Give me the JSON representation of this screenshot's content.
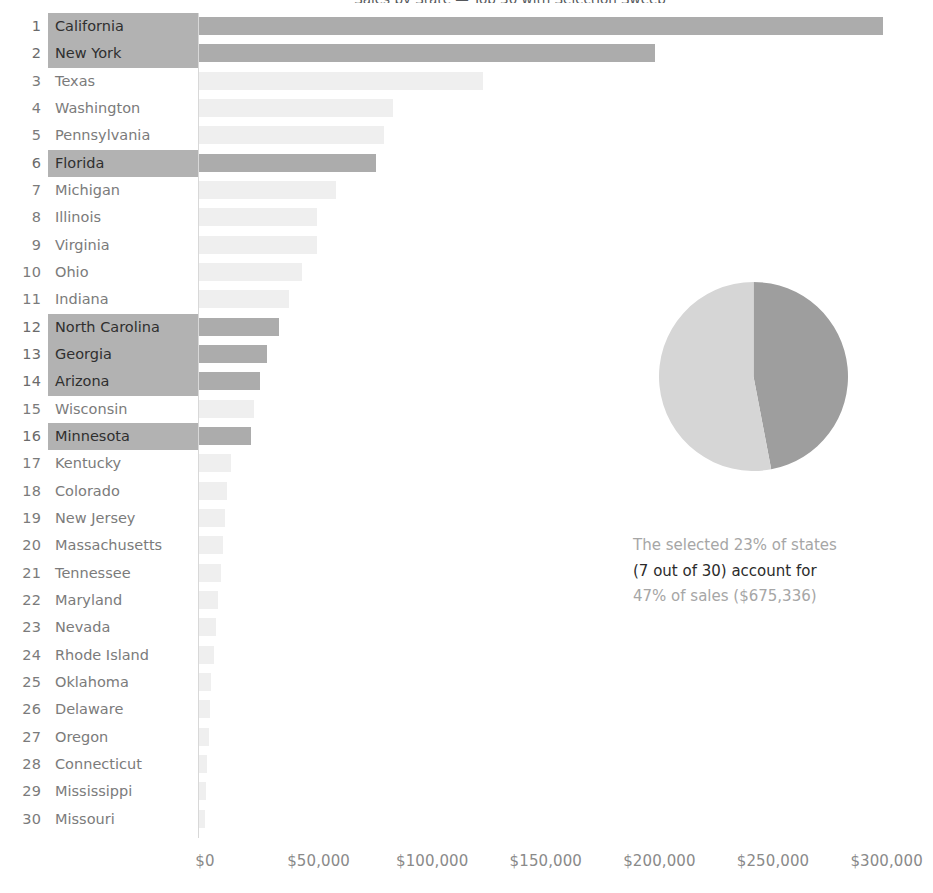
{
  "chart": {
    "title": "Sales by State — Top 30 with Selection Sweep",
    "axis_line_color": "#d8d8d8",
    "selected_color": "#acacac",
    "unselected_color": "#efefef",
    "highlight_color": "#b2b2b2"
  },
  "axis": {
    "ticks": [
      {
        "label": "$0",
        "value": 0
      },
      {
        "label": "$50,000",
        "value": 50000
      },
      {
        "label": "$100,000",
        "value": 100000
      },
      {
        "label": "$150,000",
        "value": 150000
      },
      {
        "label": "$200,000",
        "value": 200000
      },
      {
        "label": "$250,000",
        "value": 250000
      },
      {
        "label": "$300,000",
        "value": 300000
      }
    ]
  },
  "annotation": {
    "line1": "The selected 23% of states",
    "line2": "(7 out of 30) account for",
    "line3": "47% of sales ($675,336)"
  },
  "chart_data": {
    "type": "bar",
    "title": "Sales by State — Top 30 with Selection Sweep",
    "xlabel": "Sales",
    "ylabel": "",
    "xlim": [
      0,
      300000
    ],
    "orientation": "horizontal",
    "grid": false,
    "legend": "none",
    "categories": [
      "California",
      "New York",
      "Texas",
      "Washington",
      "Pennsylvania",
      "Florida",
      "Michigan",
      "Illinois",
      "Virginia",
      "Ohio",
      "Indiana",
      "North Carolina",
      "Georgia",
      "Arizona",
      "Wisconsin",
      "Minnesota",
      "Kentucky",
      "Colorado",
      "New Jersey",
      "Massachusetts",
      "Tennessee",
      "Maryland",
      "Nevada",
      "Rhode Island",
      "Oklahoma",
      "Delaware",
      "Oregon",
      "Connecticut",
      "Mississippi",
      "Missouri"
    ],
    "ranks": [
      1,
      2,
      3,
      4,
      5,
      6,
      7,
      8,
      9,
      10,
      11,
      12,
      13,
      14,
      15,
      16,
      17,
      18,
      19,
      20,
      21,
      22,
      23,
      24,
      25,
      26,
      27,
      28,
      29,
      30
    ],
    "values": [
      301000,
      200500,
      125000,
      85500,
      81500,
      78000,
      60500,
      52000,
      52000,
      45500,
      39500,
      35000,
      30000,
      27000,
      24000,
      23000,
      14000,
      12500,
      11500,
      10500,
      9500,
      8500,
      7500,
      6500,
      5500,
      4800,
      4200,
      3600,
      3000,
      2500
    ],
    "selected": [
      true,
      true,
      false,
      false,
      false,
      true,
      false,
      false,
      false,
      false,
      false,
      true,
      true,
      true,
      false,
      true,
      false,
      false,
      false,
      false,
      false,
      false,
      false,
      false,
      false,
      false,
      false,
      false,
      false,
      false
    ],
    "selected_states": [
      "California",
      "New York",
      "Florida",
      "North Carolina",
      "Georgia",
      "Arizona",
      "Minnesota"
    ],
    "selected_count": 7,
    "total_count": 30,
    "selected_pct_of_states": 23,
    "selected_pct_of_sales": 47,
    "selected_sales_total": "$675,336"
  },
  "pie_data": {
    "type": "pie",
    "slices": [
      {
        "name": "Selected states share of sales",
        "value": 47,
        "color": "#9e9e9e"
      },
      {
        "name": "Remaining states share of sales",
        "value": 53,
        "color": "#d6d6d6"
      }
    ],
    "start_angle_deg": 0
  }
}
